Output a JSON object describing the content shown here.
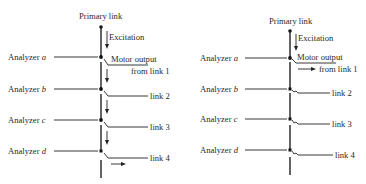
{
  "figure": {
    "left_diagram": {
      "primary_label": "Primary link",
      "excitation_label": "Excitation",
      "motor_output_line1": "Motor output",
      "motor_output_line2": "from link 1",
      "analyzers": [
        {
          "label": "Analyzer",
          "letter": "a"
        },
        {
          "label": "Analyzer",
          "letter": "b",
          "link": "link 2"
        },
        {
          "label": "Analyzer",
          "letter": "c",
          "link": "link 3"
        },
        {
          "label": "Analyzer",
          "letter": "d",
          "link": "link 4"
        }
      ]
    },
    "right_diagram": {
      "primary_label": "Primary link",
      "excitation_label": "Excitation",
      "motor_output_line1": "Motor output",
      "motor_output_line2": "from link 1",
      "analyzers": [
        {
          "label": "Analyzer",
          "letter": "a"
        },
        {
          "label": "Analyzer",
          "letter": "b",
          "link": "link 2"
        },
        {
          "label": "Analyzer",
          "letter": "c",
          "link": "link 3"
        },
        {
          "label": "Analyzer",
          "letter": "d",
          "link": "link 4"
        }
      ]
    }
  }
}
